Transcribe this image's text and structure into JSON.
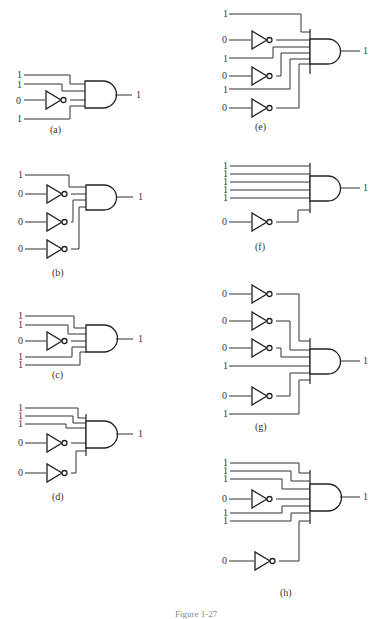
{
  "figure": {
    "caption_clipped": "Figure 1-27",
    "panels": [
      {
        "id": "a",
        "label": "(a)",
        "inputs": [
          "1",
          "1",
          "0",
          "1"
        ],
        "inverted": [
          false,
          false,
          true,
          false
        ],
        "output": "1"
      },
      {
        "id": "b",
        "label": "(b)",
        "inputs": [
          "1",
          "0",
          "0",
          "0"
        ],
        "inverted": [
          false,
          true,
          true,
          true
        ],
        "output": "1"
      },
      {
        "id": "c",
        "label": "(c)",
        "inputs": [
          "1",
          "1",
          "0",
          "1",
          "1"
        ],
        "inverted": [
          false,
          false,
          true,
          false,
          false
        ],
        "output": "1"
      },
      {
        "id": "d",
        "label": "(d)",
        "inputs": [
          "1",
          "1",
          "1",
          "0",
          "0"
        ],
        "inverted": [
          false,
          false,
          false,
          true,
          true
        ],
        "output": "1"
      },
      {
        "id": "e",
        "label": "(e)",
        "inputs": [
          "1",
          "0",
          "1",
          "0",
          "1",
          "0"
        ],
        "inverted": [
          false,
          true,
          false,
          true,
          false,
          true
        ],
        "output": "1"
      },
      {
        "id": "f",
        "label": "(f)",
        "inputs": [
          "1",
          "1",
          "1",
          "1",
          "1",
          "0"
        ],
        "inverted": [
          false,
          false,
          false,
          false,
          false,
          true
        ],
        "output": "1"
      },
      {
        "id": "g",
        "label": "(g)",
        "inputs": [
          "0",
          "0",
          "0",
          "1",
          "0",
          "1"
        ],
        "inverted": [
          true,
          true,
          true,
          false,
          true,
          false
        ],
        "output": "1"
      },
      {
        "id": "h",
        "label": "(h)",
        "inputs": [
          "1",
          "1",
          "1",
          "0",
          "1",
          "1",
          "0"
        ],
        "inverted": [
          false,
          false,
          false,
          true,
          false,
          false,
          true
        ],
        "output": "1"
      }
    ]
  }
}
